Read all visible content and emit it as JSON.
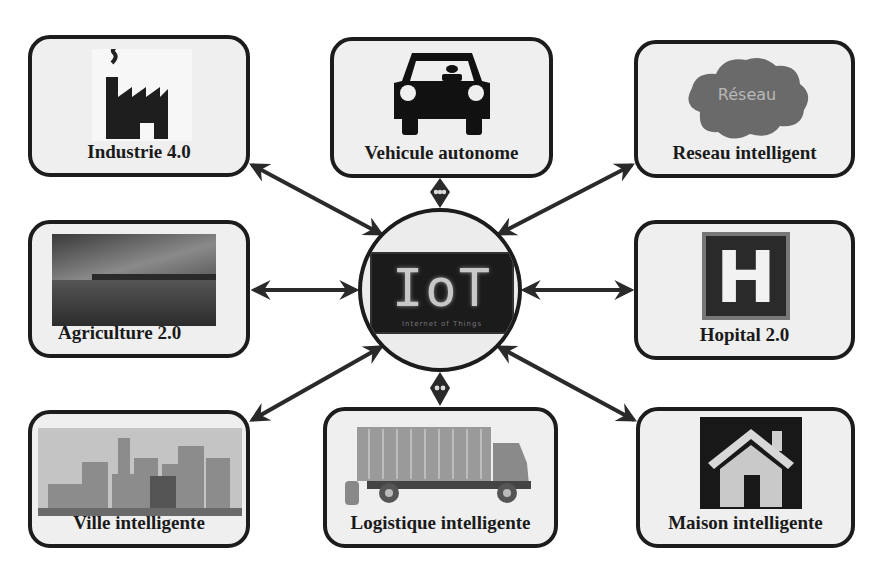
{
  "diagram": {
    "center": {
      "title": "IoT",
      "subtitle": "Internet of Things",
      "icon": "iot-screen-icon"
    },
    "nodes": [
      {
        "id": "industrie",
        "label": "Industrie 4.0",
        "icon": "factory-icon",
        "position": "top-left"
      },
      {
        "id": "vehicule",
        "label": "Vehicule autonome",
        "icon": "car-icon",
        "position": "top-center"
      },
      {
        "id": "reseau",
        "label": "Reseau intelligent",
        "icon": "cloud-icon",
        "icon_text": "Réseau",
        "position": "top-right"
      },
      {
        "id": "agriculture",
        "label": "Agriculture 2.0",
        "icon": "field-photo-icon",
        "position": "middle-left"
      },
      {
        "id": "hopital",
        "label": "Hopital 2.0",
        "icon": "hospital-icon",
        "icon_text": "H",
        "position": "middle-right"
      },
      {
        "id": "ville",
        "label": "Ville intelligente",
        "icon": "city-skyline-icon",
        "position": "bottom-left"
      },
      {
        "id": "logistique",
        "label": "Logistique intelligente",
        "icon": "truck-icon",
        "position": "bottom-center"
      },
      {
        "id": "maison",
        "label": "Maison intelligente",
        "icon": "house-icon",
        "position": "bottom-right"
      }
    ],
    "edges": [
      {
        "from": "IoT",
        "to": "industrie",
        "type": "bidirectional"
      },
      {
        "from": "IoT",
        "to": "vehicule",
        "type": "bidirectional"
      },
      {
        "from": "IoT",
        "to": "reseau",
        "type": "bidirectional"
      },
      {
        "from": "IoT",
        "to": "agriculture",
        "type": "bidirectional"
      },
      {
        "from": "IoT",
        "to": "hopital",
        "type": "bidirectional"
      },
      {
        "from": "IoT",
        "to": "ville",
        "type": "bidirectional"
      },
      {
        "from": "IoT",
        "to": "logistique",
        "type": "bidirectional"
      },
      {
        "from": "IoT",
        "to": "maison",
        "type": "bidirectional"
      }
    ],
    "colors": {
      "border": "#1c1c1c",
      "box_fill": "#efefef",
      "arrow": "#2a2a2a",
      "text": "#1a1a1a"
    }
  }
}
